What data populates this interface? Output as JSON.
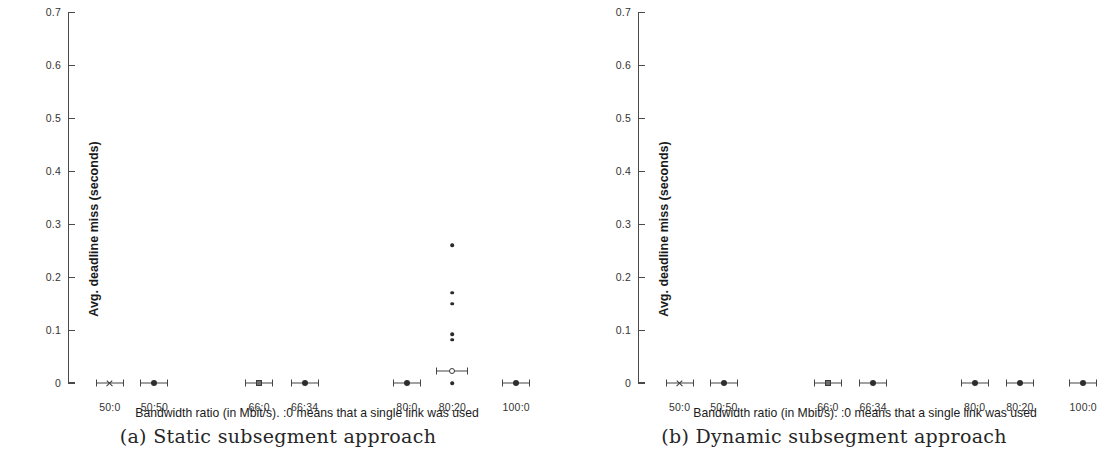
{
  "figure": {
    "panels": [
      {
        "id": "static",
        "caption": "(a) Static subsegment approach",
        "chart_index": 0
      },
      {
        "id": "dynamic",
        "caption": "(b) Dynamic subsegment approach",
        "chart_index": 1
      }
    ]
  },
  "chart_data": [
    {
      "type": "scatter",
      "title": "(a) Static subsegment approach",
      "xlabel": "Bandwidth ratio (in Mbit/s). :0 means that a single link was used",
      "ylabel": "Avg. deadline miss (seconds)",
      "categories": [
        "50:0",
        "50:50",
        "66:0",
        "66:34",
        "80:0",
        "80:20",
        "100:0"
      ],
      "ylim": [
        0,
        0.7
      ],
      "yticks": [
        0,
        0.1,
        0.2,
        0.3,
        0.4,
        0.5,
        0.6,
        0.7
      ],
      "ytick_labels": [
        "0",
        "0.1",
        "0.2",
        "0.3",
        "0.4",
        "0.5",
        "0.6",
        "0.7"
      ],
      "grid": false,
      "legend": "none",
      "series": [
        {
          "name": "mean with error bars",
          "points": [
            {
              "category": "50:0",
              "x_frac": 0.092,
              "value": 0.0,
              "err_px": 14,
              "marker": "cross"
            },
            {
              "category": "50:50",
              "x_frac": 0.19,
              "value": 0.0,
              "err_px": 14,
              "marker": "circle-filled"
            },
            {
              "category": "66:0",
              "x_frac": 0.42,
              "value": 0.0,
              "err_px": 14,
              "marker": "square-filled"
            },
            {
              "category": "66:34",
              "x_frac": 0.52,
              "value": 0.0,
              "err_px": 14,
              "marker": "circle-filled"
            },
            {
              "category": "80:0",
              "x_frac": 0.745,
              "value": 0.0,
              "err_px": 14,
              "marker": "circle-filled"
            },
            {
              "category": "80:20",
              "x_frac": 0.845,
              "value": 0.022,
              "err_px": 16,
              "marker": "circle-open"
            },
            {
              "category": "100:0",
              "x_frac": 0.985,
              "value": 0.0,
              "err_px": 14,
              "marker": "circle-filled"
            }
          ]
        },
        {
          "name": "individual samples",
          "points": [
            {
              "category": "80:20",
              "x_frac": 0.845,
              "value": 0.26
            },
            {
              "category": "80:20",
              "x_frac": 0.845,
              "value": 0.17
            },
            {
              "category": "80:20",
              "x_frac": 0.845,
              "value": 0.15
            },
            {
              "category": "80:20",
              "x_frac": 0.845,
              "value": 0.092
            },
            {
              "category": "80:20",
              "x_frac": 0.845,
              "value": 0.082
            },
            {
              "category": "80:20",
              "x_frac": 0.845,
              "value": 0.0
            }
          ]
        }
      ]
    },
    {
      "type": "scatter",
      "title": "(b) Dynamic subsegment approach",
      "xlabel": "Bandwidth ratio (in Mbit/s). :0 means that a single link was used",
      "ylabel": "Avg. deadline miss (seconds)",
      "categories": [
        "50:0",
        "50:50",
        "66:0",
        "66:34",
        "80:0",
        "80:20",
        "100:0"
      ],
      "ylim": [
        0,
        0.7
      ],
      "yticks": [
        0,
        0.1,
        0.2,
        0.3,
        0.4,
        0.5,
        0.6,
        0.7
      ],
      "ytick_labels": [
        "0",
        "0.1",
        "0.2",
        "0.3",
        "0.4",
        "0.5",
        "0.6",
        "0.7"
      ],
      "grid": false,
      "legend": "none",
      "series": [
        {
          "name": "mean with error bars",
          "points": [
            {
              "category": "50:0",
              "x_frac": 0.092,
              "value": 0.0,
              "err_px": 14,
              "marker": "cross"
            },
            {
              "category": "50:50",
              "x_frac": 0.19,
              "value": 0.0,
              "err_px": 14,
              "marker": "circle-filled"
            },
            {
              "category": "66:0",
              "x_frac": 0.42,
              "value": 0.0,
              "err_px": 14,
              "marker": "square-filled"
            },
            {
              "category": "66:34",
              "x_frac": 0.52,
              "value": 0.0,
              "err_px": 14,
              "marker": "circle-filled"
            },
            {
              "category": "80:0",
              "x_frac": 0.745,
              "value": 0.0,
              "err_px": 14,
              "marker": "circle-filled"
            },
            {
              "category": "80:20",
              "x_frac": 0.845,
              "value": 0.0,
              "err_px": 14,
              "marker": "circle-filled"
            },
            {
              "category": "100:0",
              "x_frac": 0.985,
              "value": 0.0,
              "err_px": 14,
              "marker": "circle-filled"
            }
          ]
        },
        {
          "name": "individual samples",
          "points": []
        }
      ]
    }
  ]
}
